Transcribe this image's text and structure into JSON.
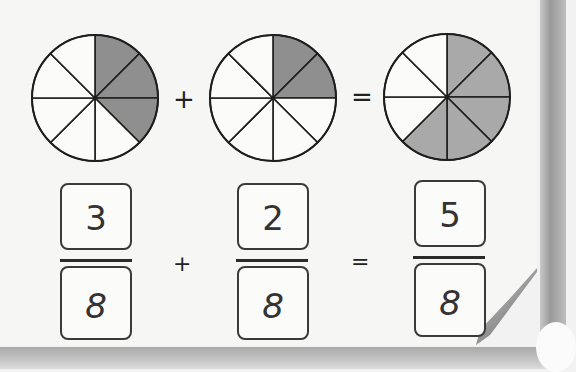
{
  "equation": {
    "fractions": [
      {
        "numerator": "3",
        "denominator": "8",
        "shaded_parts": 3,
        "total_parts": 8
      },
      {
        "numerator": "2",
        "denominator": "8",
        "shaded_parts": 2,
        "total_parts": 8
      },
      {
        "numerator": "5",
        "denominator": "8",
        "shaded_parts": 5,
        "total_parts": 8
      }
    ],
    "operators": {
      "plus": "+",
      "equals": "="
    }
  },
  "colors": {
    "shade_dark": "#8f8f8f",
    "shade_light": "#a9a9a9",
    "outline": "#1e1e1e"
  }
}
